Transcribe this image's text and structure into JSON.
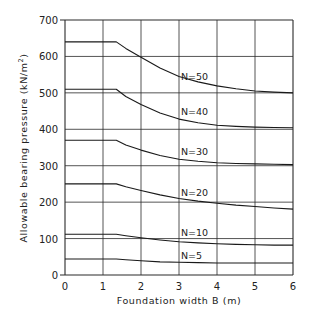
{
  "chart_data": {
    "type": "line",
    "title": "",
    "xlabel": "Foundation width   B (m)",
    "ylabel": "Allowable bearing pressure (kN/m²)",
    "ylabel_parts": {
      "main": "Allowable bearing pressure (kN/m",
      "sup": "2",
      "close": ")"
    },
    "xlim": [
      0,
      6
    ],
    "ylim": [
      0,
      700
    ],
    "x_ticks": [
      "0",
      "1",
      "2",
      "3",
      "4",
      "5",
      "6"
    ],
    "y_ticks": [
      "0",
      "100",
      "200",
      "300",
      "400",
      "500",
      "600",
      "700"
    ],
    "grid": true,
    "legend": "inline labels",
    "series": [
      {
        "name": "N=50",
        "label_pos": [
          3.05,
          535
        ],
        "points": [
          [
            0,
            640
          ],
          [
            1.35,
            640
          ],
          [
            1.6,
            622
          ],
          [
            2,
            598
          ],
          [
            2.5,
            568
          ],
          [
            3,
            545
          ],
          [
            3.5,
            530
          ],
          [
            4,
            519
          ],
          [
            4.5,
            511
          ],
          [
            5,
            505
          ],
          [
            5.5,
            502
          ],
          [
            6,
            500
          ]
        ]
      },
      {
        "name": "N=40",
        "label_pos": [
          3.05,
          440
        ],
        "points": [
          [
            0,
            510
          ],
          [
            1.35,
            510
          ],
          [
            1.6,
            490
          ],
          [
            2,
            468
          ],
          [
            2.5,
            445
          ],
          [
            3,
            428
          ],
          [
            3.5,
            418
          ],
          [
            4,
            411
          ],
          [
            4.5,
            408
          ],
          [
            5,
            406
          ],
          [
            5.5,
            405
          ],
          [
            6,
            404
          ]
        ]
      },
      {
        "name": "N=30",
        "label_pos": [
          3.05,
          330
        ],
        "points": [
          [
            0,
            370
          ],
          [
            1.35,
            370
          ],
          [
            1.6,
            357
          ],
          [
            2,
            343
          ],
          [
            2.5,
            328
          ],
          [
            3,
            318
          ],
          [
            3.5,
            312
          ],
          [
            4,
            308
          ],
          [
            4.5,
            306
          ],
          [
            5,
            305
          ],
          [
            5.5,
            304
          ],
          [
            6,
            303
          ]
        ]
      },
      {
        "name": "N=20",
        "label_pos": [
          3.05,
          217
        ],
        "points": [
          [
            0,
            250
          ],
          [
            1.35,
            250
          ],
          [
            1.6,
            242
          ],
          [
            2,
            232
          ],
          [
            2.5,
            220
          ],
          [
            3,
            210
          ],
          [
            3.5,
            203
          ],
          [
            4,
            197
          ],
          [
            4.5,
            192
          ],
          [
            5,
            188
          ],
          [
            5.5,
            184
          ],
          [
            6,
            181
          ]
        ]
      },
      {
        "name": "N=10",
        "label_pos": [
          3.05,
          107
        ],
        "points": [
          [
            0,
            112
          ],
          [
            1.35,
            112
          ],
          [
            1.6,
            108
          ],
          [
            2,
            102
          ],
          [
            2.5,
            96
          ],
          [
            3,
            91
          ],
          [
            3.5,
            88
          ],
          [
            4,
            86
          ],
          [
            4.5,
            84
          ],
          [
            5,
            83
          ],
          [
            5.5,
            82
          ],
          [
            6,
            82
          ]
        ]
      },
      {
        "name": "N=5",
        "label_pos": [
          3.05,
          44
        ],
        "points": [
          [
            0,
            44
          ],
          [
            1.35,
            44
          ],
          [
            1.6,
            42
          ],
          [
            2,
            39
          ],
          [
            2.5,
            36
          ],
          [
            3,
            35
          ],
          [
            3.5,
            34
          ],
          [
            4,
            33
          ],
          [
            4.5,
            33
          ],
          [
            5,
            33
          ],
          [
            5.5,
            33
          ],
          [
            6,
            33
          ]
        ]
      }
    ]
  },
  "layout": {
    "plot_left": 65,
    "plot_right": 293,
    "plot_top": 20,
    "plot_bottom": 275
  },
  "colors": {
    "line": "#1a1a1a",
    "grid": "#2a2a2a",
    "background": "#ffffff"
  }
}
